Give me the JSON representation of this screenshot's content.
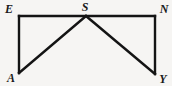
{
  "figure": {
    "caption": "",
    "background_color": "#f6f5f3",
    "stroke_color": "#141414",
    "stroke_width": 2.4,
    "vertices": [
      {
        "id": "E",
        "label": "E",
        "x": 19,
        "y": 16,
        "label_x": 9,
        "label_y": 9
      },
      {
        "id": "S",
        "label": "S",
        "x": 86,
        "y": 16,
        "label_x": 85,
        "label_y": 7
      },
      {
        "id": "N",
        "label": "N",
        "x": 155,
        "y": 16,
        "label_x": 164,
        "label_y": 9
      },
      {
        "id": "A",
        "label": "A",
        "x": 19,
        "y": 73,
        "label_x": 11,
        "label_y": 78
      },
      {
        "id": "Y",
        "label": "Y",
        "x": 155,
        "y": 74,
        "label_x": 163,
        "label_y": 79
      }
    ],
    "segments": [
      {
        "id": "E-N",
        "from": "E",
        "to": "N",
        "x1": 19,
        "y1": 16,
        "x2": 155,
        "y2": 16
      },
      {
        "id": "E-A",
        "from": "E",
        "to": "A",
        "x1": 19,
        "y1": 16,
        "x2": 19,
        "y2": 73
      },
      {
        "id": "N-Y",
        "from": "N",
        "to": "Y",
        "x1": 155,
        "y1": 16,
        "x2": 155,
        "y2": 74
      },
      {
        "id": "A-S",
        "from": "A",
        "to": "S",
        "x1": 19,
        "y1": 73,
        "x2": 86,
        "y2": 16
      },
      {
        "id": "S-Y",
        "from": "S",
        "to": "Y",
        "x1": 86,
        "y1": 16,
        "x2": 155,
        "y2": 74
      }
    ]
  }
}
